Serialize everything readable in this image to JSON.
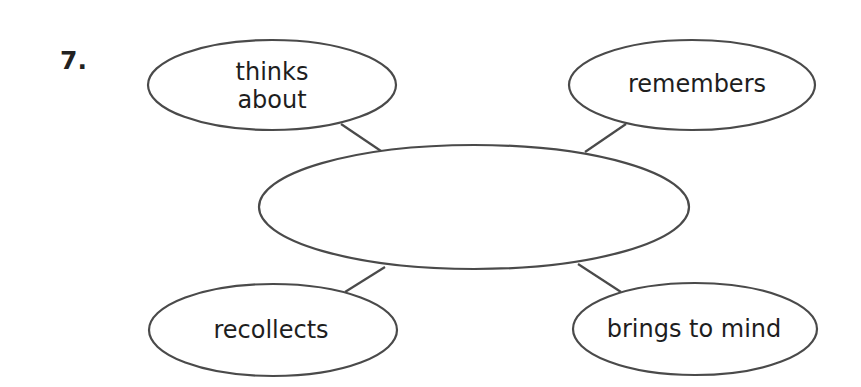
{
  "question": {
    "number": "7."
  },
  "diagram": {
    "type": "word-web",
    "center": {
      "label": ""
    },
    "nodes": [
      {
        "id": "top-left",
        "label_line1": "thinks",
        "label_line2": "about"
      },
      {
        "id": "top-right",
        "label_line1": "remembers",
        "label_line2": ""
      },
      {
        "id": "bottom-left",
        "label_line1": "recollects",
        "label_line2": ""
      },
      {
        "id": "bottom-right",
        "label_line1": "brings to mind",
        "label_line2": ""
      }
    ],
    "colors": {
      "stroke": "#4a4a4a",
      "text": "#1e1e1e",
      "background": "#ffffff"
    }
  }
}
